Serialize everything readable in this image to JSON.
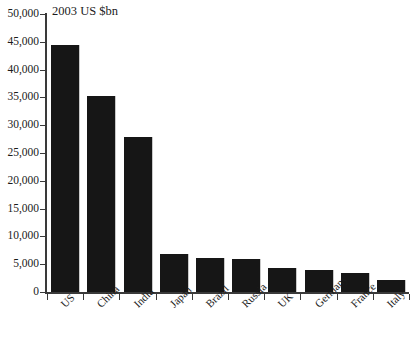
{
  "chart_data": {
    "type": "bar",
    "title": "2003 US $bn",
    "xlabel": "",
    "ylabel": "",
    "ylim": [
      0,
      50000
    ],
    "grid": false,
    "legend": false,
    "categories": [
      "US",
      "China",
      "India",
      "Japan",
      "Brazil",
      "Russia",
      "UK",
      "Germany",
      "France",
      "Italy"
    ],
    "values": [
      44500,
      35200,
      27800,
      6900,
      6100,
      6000,
      4300,
      3900,
      3500,
      2100
    ],
    "ytick_labels": [
      "0",
      "5,000",
      "10,000",
      "15,000",
      "20,000",
      "25,000",
      "30,000",
      "35,000",
      "40,000",
      "45,000",
      "50,000"
    ],
    "ytick_values": [
      0,
      5000,
      10000,
      15000,
      20000,
      25000,
      30000,
      35000,
      40000,
      45000,
      50000
    ],
    "bar_color": "#161616",
    "axis_color": "#3a3a3a",
    "text_color": "#1b1b1b"
  }
}
